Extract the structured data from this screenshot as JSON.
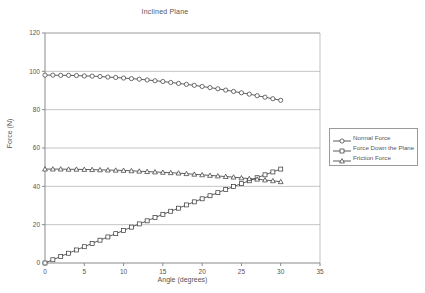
{
  "chart_data": {
    "type": "line",
    "title": "Inclined Plane",
    "xlabel": "Angle (degrees)",
    "ylabel": "Force (N)",
    "xlim": [
      0,
      35
    ],
    "ylim": [
      0,
      120
    ],
    "xticks": [
      0,
      5,
      10,
      15,
      20,
      25,
      30,
      35
    ],
    "yticks": [
      0,
      20,
      40,
      60,
      80,
      100,
      120
    ],
    "grid": "horizontal",
    "legend_position": "right",
    "x": [
      0,
      1,
      2,
      3,
      4,
      5,
      6,
      7,
      8,
      9,
      10,
      11,
      12,
      13,
      14,
      15,
      16,
      17,
      18,
      19,
      20,
      21,
      22,
      23,
      24,
      25,
      26,
      27,
      28,
      29,
      30
    ],
    "series": [
      {
        "name": "Normal Force",
        "marker": "circle",
        "values": [
          98.0,
          98.0,
          97.9,
          97.9,
          97.8,
          97.6,
          97.5,
          97.3,
          97.0,
          96.8,
          96.5,
          96.2,
          95.9,
          95.5,
          95.1,
          94.7,
          94.2,
          93.7,
          93.2,
          92.7,
          92.1,
          91.5,
          90.9,
          90.2,
          89.5,
          88.8,
          88.1,
          87.3,
          86.5,
          85.7,
          84.9
        ]
      },
      {
        "name": "Force Down the Plane",
        "marker": "square",
        "values": [
          0.0,
          1.7,
          3.4,
          5.1,
          6.8,
          8.5,
          10.2,
          11.9,
          13.6,
          15.3,
          17.0,
          18.7,
          20.4,
          22.0,
          23.7,
          25.4,
          27.0,
          28.6,
          30.3,
          31.9,
          33.5,
          35.1,
          36.7,
          38.3,
          39.9,
          41.4,
          42.9,
          44.5,
          46.0,
          47.5,
          49.0
        ]
      },
      {
        "name": "Friction Force",
        "marker": "triangle",
        "values": [
          49.0,
          49.0,
          49.0,
          48.9,
          48.9,
          48.8,
          48.7,
          48.6,
          48.5,
          48.4,
          48.3,
          48.1,
          47.9,
          47.7,
          47.5,
          47.3,
          47.1,
          46.9,
          46.6,
          46.3,
          46.0,
          45.7,
          45.4,
          45.1,
          44.8,
          44.4,
          44.0,
          43.7,
          43.3,
          42.9,
          42.4
        ]
      }
    ]
  },
  "colors": {
    "axis": "#8a8a8a",
    "grid": "#aaaaaa",
    "series": "#333333",
    "text": "#555555"
  }
}
